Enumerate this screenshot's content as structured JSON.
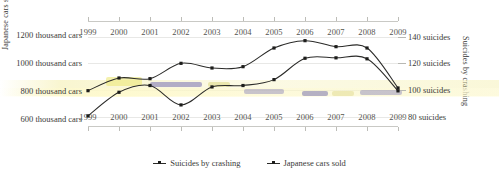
{
  "chart_data": {
    "type": "line",
    "title": "",
    "subtitle": "",
    "x": [
      1999,
      2000,
      2001,
      2002,
      2003,
      2004,
      2005,
      2006,
      2007,
      2008,
      2009
    ],
    "xlabel": "",
    "grid": true,
    "legend_position": "bottom",
    "axes": {
      "x_top": {
        "ticks": [
          "1999",
          "2000",
          "2001",
          "2002",
          "2003",
          "2004",
          "2005",
          "2006",
          "2007",
          "2008",
          "2009"
        ]
      },
      "x_bottom": {
        "ticks": [
          "1999",
          "2000",
          "2001",
          "2002",
          "2003",
          "2004",
          "2005",
          "2006",
          "2007",
          "2008",
          "2009"
        ]
      },
      "y_left": {
        "title": "Japanese cars sold",
        "ticks": [
          "1200 thousand cars",
          "1000 thousand cars",
          "800 thousand cars",
          "600 thousand cars"
        ],
        "tick_values": [
          1200,
          1000,
          800,
          600
        ],
        "ylim": [
          550,
          1290
        ]
      },
      "y_right": {
        "title": "Suicides by crashing",
        "ticks": [
          "140 suicides",
          "120 suicides",
          "100 suicides",
          "80 suicides"
        ],
        "tick_values": [
          140,
          120,
          100,
          80
        ],
        "ylim": [
          73,
          151
        ]
      }
    },
    "series": [
      {
        "name": "Suicides by crashing",
        "axis": "right",
        "color": "#2b2b29",
        "values": [
          99.5,
          109.0,
          108.5,
          120.0,
          116.5,
          117.5,
          131.5,
          137.0,
          132.5,
          131.5,
          101.5
        ]
      },
      {
        "name": "Japanese cars sold",
        "axis": "left",
        "color": "#2b2b29",
        "values": [
          622,
          790,
          838,
          700,
          828,
          838,
          880,
          1032,
          1035,
          1028,
          800
        ]
      }
    ]
  },
  "legend": {
    "items": [
      {
        "label": "Suicides by crashing"
      },
      {
        "label": "Japanese cars sold"
      }
    ]
  }
}
